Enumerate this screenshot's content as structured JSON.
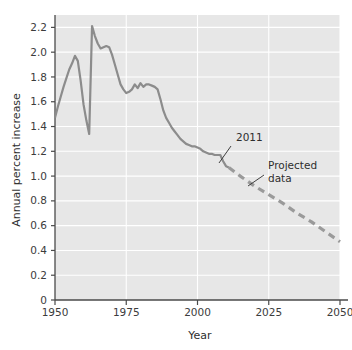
{
  "chart_data": {
    "type": "line",
    "title": "",
    "xlabel": "Year",
    "ylabel": "Annual percent increase",
    "xlim": [
      1950,
      2050
    ],
    "ylim": [
      0,
      2.3
    ],
    "xticks": [
      1950,
      1975,
      2000,
      2025,
      2050
    ],
    "xticklabels": [
      "1950",
      "1975",
      "2000",
      "2025",
      "2050"
    ],
    "yticks": [
      0,
      0.2,
      0.4,
      0.6,
      0.8,
      1.0,
      1.2,
      1.4,
      1.6,
      1.8,
      2.0,
      2.2
    ],
    "yticklabels": [
      "0",
      "0.2",
      "0.4",
      "0.6",
      "0.8",
      "1.0",
      "1.2",
      "1.4",
      "1.6",
      "1.8",
      "2.0",
      "2.2"
    ],
    "grid": true,
    "grid_color": "#ffffff",
    "plot_background": "#e7e7e7",
    "legend": "none",
    "series": [
      {
        "name": "Historical data",
        "style": "solid",
        "color": "#8c8c8c",
        "x": [
          1950,
          1951,
          1952,
          1953,
          1954,
          1955,
          1956,
          1957,
          1958,
          1959,
          1960,
          1961,
          1962,
          1963,
          1964,
          1965,
          1966,
          1967,
          1968,
          1969,
          1970,
          1971,
          1972,
          1973,
          1974,
          1975,
          1976,
          1977,
          1978,
          1979,
          1980,
          1981,
          1982,
          1983,
          1984,
          1985,
          1986,
          1987,
          1988,
          1989,
          1990,
          1991,
          1992,
          1993,
          1994,
          1995,
          1996,
          1997,
          1998,
          1999,
          2000,
          2001,
          2002,
          2003,
          2004,
          2005,
          2006,
          2007,
          2008,
          2009,
          2010,
          2011
        ],
        "y": [
          1.47,
          1.56,
          1.64,
          1.72,
          1.79,
          1.86,
          1.91,
          1.97,
          1.93,
          1.77,
          1.58,
          1.45,
          1.34,
          2.21,
          2.13,
          2.07,
          2.03,
          2.04,
          2.05,
          2.04,
          1.98,
          1.9,
          1.82,
          1.74,
          1.7,
          1.67,
          1.68,
          1.7,
          1.74,
          1.71,
          1.75,
          1.72,
          1.74,
          1.74,
          1.73,
          1.72,
          1.7,
          1.62,
          1.53,
          1.47,
          1.43,
          1.39,
          1.36,
          1.33,
          1.3,
          1.28,
          1.26,
          1.25,
          1.24,
          1.24,
          1.23,
          1.22,
          1.2,
          1.19,
          1.18,
          1.18,
          1.17,
          1.17,
          1.17,
          1.12,
          1.08,
          1.07
        ]
      },
      {
        "name": "Projected data",
        "style": "dashed",
        "color": "#9a9a9a",
        "x": [
          2011,
          2015,
          2020,
          2025,
          2030,
          2035,
          2040,
          2045,
          2050
        ],
        "y": [
          1.07,
          1.0,
          0.92,
          0.85,
          0.78,
          0.7,
          0.63,
          0.55,
          0.47
        ]
      }
    ],
    "annotations": [
      {
        "text": "2011",
        "label_x": 236,
        "label_y": 141,
        "leader_from_x": 231,
        "leader_from_y": 146,
        "leader_to_x": 219,
        "leader_to_y": 163
      },
      {
        "text": "Projected",
        "label_x": 268,
        "label_y": 169,
        "leader_from_x": 264,
        "leader_from_y": 175,
        "leader_to_x": 248,
        "leader_to_y": 186
      },
      {
        "text": "data",
        "label_x": 268,
        "label_y": 182,
        "leader_from_x": null,
        "leader_from_y": null,
        "leader_to_x": null,
        "leader_to_y": null
      }
    ]
  }
}
